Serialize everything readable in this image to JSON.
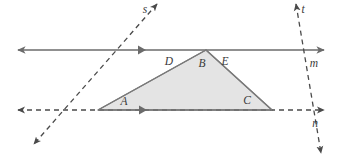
{
  "figure": {
    "background_color": "#ffffff",
    "stroke_color": "#6b6b6b",
    "dash_color": "#5a5a5a",
    "triangle_fill": "#e4e4e4",
    "triangle_stroke": "#7a7a7a",
    "label_color": "#3a3a3a"
  },
  "points": {
    "A": {
      "label": "A",
      "x": 98,
      "y": 110,
      "label_x": 124,
      "label_y": 105
    },
    "B": {
      "label": "B",
      "x": 206,
      "y": 50,
      "label_x": 202,
      "label_y": 67
    },
    "C": {
      "label": "C",
      "x": 272,
      "y": 110,
      "label_x": 247,
      "label_y": 104
    },
    "D": {
      "label": "D",
      "x": 176,
      "y": 64,
      "label_x": 169,
      "label_y": 65
    },
    "E": {
      "label": "E",
      "x": 232,
      "y": 64,
      "label_x": 225,
      "label_y": 65
    }
  },
  "lines": {
    "m": {
      "label": "m",
      "label_x": 314,
      "label_y": 67,
      "style": "solid",
      "x1": 18,
      "y1": 50,
      "x2": 324,
      "y2": 50,
      "arrow_start": true,
      "arrow_end": true,
      "tick_x": 142,
      "tick_y": 50
    },
    "n": {
      "label": "n",
      "label_x": 315,
      "label_y": 127,
      "style": "dashed",
      "x1": 18,
      "y1": 110,
      "x2": 324,
      "y2": 110,
      "arrow_start": true,
      "arrow_end": true
    },
    "s": {
      "label": "s",
      "label_x": 145,
      "label_y": 13,
      "style": "dashed",
      "x1": 157,
      "y1": 4,
      "x2": 34,
      "y2": 144,
      "arrow_start": true,
      "arrow_end": true
    },
    "t": {
      "label": "t",
      "label_x": 303,
      "label_y": 13,
      "style": "dashed",
      "x1": 296,
      "y1": 4,
      "x2": 321,
      "y2": 153,
      "arrow_start": true,
      "arrow_end": true
    }
  },
  "triangle": {
    "name": "triangle-ABC",
    "vertices": "98,110 206,50 272,110",
    "segment_tick_x": 143,
    "segment_tick_y": 110
  },
  "marks": {
    "parallel_tick": "single-chevron"
  }
}
